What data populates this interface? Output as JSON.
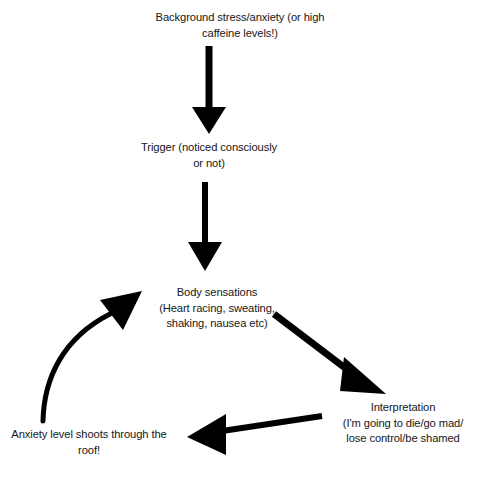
{
  "diagram": {
    "background_color": "#ffffff",
    "text_color": "#16171a",
    "arrow_color": "#000000",
    "nodes": [
      {
        "id": "background",
        "name": "background-stress",
        "text": "Background stress/anxiety (or high\ncaffeine levels!)"
      },
      {
        "id": "trigger",
        "name": "trigger",
        "text": "Trigger (noticed consciously\nor not)"
      },
      {
        "id": "body",
        "name": "body-sensations",
        "text": "Body sensations\n(Heart racing, sweating,\nshaking, nausea etc)"
      },
      {
        "id": "interpretation",
        "name": "interpretation",
        "text": "Interpretation\n(I'm going to die/go mad/\nlose control/be shamed"
      },
      {
        "id": "anxiety",
        "name": "anxiety-level",
        "text": "Anxiety level shoots through the\nroof!"
      }
    ],
    "connectors": [
      {
        "id": "arrow-1",
        "name": "arrow-background-to-trigger",
        "from": "background",
        "to": "trigger",
        "style": "straight-down"
      },
      {
        "id": "arrow-2",
        "name": "arrow-trigger-to-body",
        "from": "trigger",
        "to": "body",
        "style": "straight-down"
      },
      {
        "id": "arrow-3",
        "name": "arrow-body-to-interpretation",
        "from": "body",
        "to": "interpretation",
        "style": "diagonal-down-right"
      },
      {
        "id": "arrow-4",
        "name": "arrow-interpretation-to-anxiety",
        "from": "interpretation",
        "to": "anxiety",
        "style": "straight-left"
      },
      {
        "id": "arrow-5",
        "name": "arrow-anxiety-to-body",
        "from": "anxiety",
        "to": "body",
        "style": "curved-up-right"
      }
    ]
  }
}
